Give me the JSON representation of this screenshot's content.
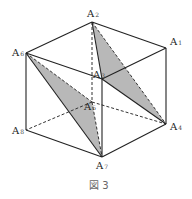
{
  "figure": {
    "caption": "図 3",
    "shade_color": "#b8b8b8",
    "vertices": {
      "A1": {
        "label": "A",
        "sub": "1",
        "x": 166,
        "y": 48
      },
      "A2": {
        "label": "A",
        "sub": "2",
        "x": 92,
        "y": 22
      },
      "A3": {
        "label": "A",
        "sub": "3",
        "x": 102,
        "y": 79
      },
      "A4": {
        "label": "A",
        "sub": "4",
        "x": 166,
        "y": 124
      },
      "A5": {
        "label": "A",
        "sub": "5",
        "x": 92,
        "y": 102
      },
      "A6": {
        "label": "A",
        "sub": "6",
        "x": 26,
        "y": 53
      },
      "A7": {
        "label": "A",
        "sub": "7",
        "x": 102,
        "y": 157
      },
      "A8": {
        "label": "A",
        "sub": "8",
        "x": 26,
        "y": 130
      }
    },
    "shaded_triangles": [
      [
        "A2",
        "A3",
        "A4"
      ],
      [
        "A6",
        "A5",
        "A7"
      ]
    ],
    "solid_edges": [
      [
        "A2",
        "A1"
      ],
      [
        "A2",
        "A6"
      ],
      [
        "A6",
        "A3"
      ],
      [
        "A3",
        "A1"
      ],
      [
        "A1",
        "A4"
      ],
      [
        "A6",
        "A8"
      ],
      [
        "A3",
        "A7"
      ],
      [
        "A8",
        "A7"
      ],
      [
        "A7",
        "A4"
      ],
      [
        "A2",
        "A3"
      ],
      [
        "A3",
        "A4"
      ],
      [
        "A6",
        "A7"
      ]
    ],
    "dashed_edges": [
      [
        "A2",
        "A5"
      ],
      [
        "A5",
        "A8"
      ],
      [
        "A5",
        "A4"
      ],
      [
        "A5",
        "A7"
      ],
      [
        "A6",
        "A5"
      ],
      [
        "A2",
        "A4"
      ]
    ]
  }
}
